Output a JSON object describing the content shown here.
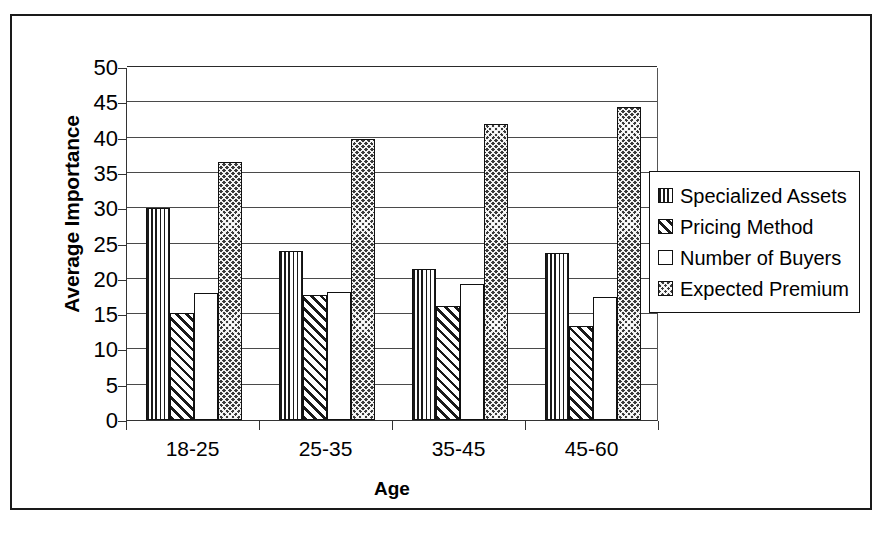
{
  "chart_data": {
    "type": "bar",
    "title": "",
    "xlabel": "Age",
    "ylabel": "Average Importance",
    "categories": [
      "18-25",
      "25-35",
      "35-45",
      "45-60"
    ],
    "series": [
      {
        "name": "Specialized Assets",
        "pattern": "vertical-stripes",
        "values": [
          30.0,
          23.9,
          21.4,
          23.6
        ]
      },
      {
        "name": "Pricing Method",
        "pattern": "diagonal-hatch",
        "values": [
          15.1,
          17.7,
          16.2,
          13.3
        ]
      },
      {
        "name": "Number of Buyers",
        "pattern": "white-empty",
        "values": [
          18.0,
          18.1,
          19.3,
          17.4
        ]
      },
      {
        "name": "Expected Premium",
        "pattern": "cross-hatch",
        "values": [
          36.5,
          39.8,
          41.9,
          44.4
        ]
      }
    ],
    "ylim": [
      0,
      50
    ],
    "ytick_step": 5,
    "yticks": [
      "50",
      "45",
      "40",
      "35",
      "30",
      "25",
      "20",
      "15",
      "10",
      "5",
      "0"
    ],
    "grid": true,
    "legend_position": "right",
    "colors": {
      "axis": "#333333",
      "gridline": "#4a4a4a",
      "pattern_ink": "#1a1a1a",
      "background": "#ffffff",
      "frame": "#1a1a1a"
    }
  },
  "legend": {
    "items": [
      {
        "label": "Specialized Assets",
        "swatch": "vertical-stripes"
      },
      {
        "label": "Pricing Method",
        "swatch": "diagonal-hatch"
      },
      {
        "label": "Number of Buyers",
        "swatch": "white-empty"
      },
      {
        "label": "Expected Premium",
        "swatch": "cross-hatch"
      }
    ]
  }
}
